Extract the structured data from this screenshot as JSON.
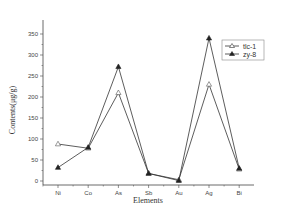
{
  "chart_data": {
    "type": "line",
    "title": "",
    "xlabel": "Elements",
    "ylabel": "Contents(μg/g)",
    "categories": [
      "Ni",
      "Co",
      "As",
      "Sb",
      "Au",
      "Ag",
      "Bi"
    ],
    "series": [
      {
        "name": "tlc-1",
        "marker": "open-triangle",
        "values": [
          88,
          78,
          210,
          18,
          3,
          230,
          28
        ]
      },
      {
        "name": "zy-8",
        "marker": "filled-triangle",
        "values": [
          32,
          80,
          272,
          18,
          1,
          340,
          30
        ]
      }
    ],
    "yticks": [
      0,
      50,
      100,
      150,
      200,
      250,
      300,
      350
    ],
    "ylim": [
      -10,
      375
    ],
    "grid": false,
    "legend_position": "upper-right"
  },
  "axes": {
    "xlabel": "Elements",
    "ylabel": "Contents(μg/g)"
  },
  "legend": {
    "items": [
      {
        "label": "tlc-1"
      },
      {
        "label": "zy-8"
      }
    ]
  },
  "colors": {
    "line": "#333333",
    "axis": "#444444",
    "background": "#ffffff"
  }
}
